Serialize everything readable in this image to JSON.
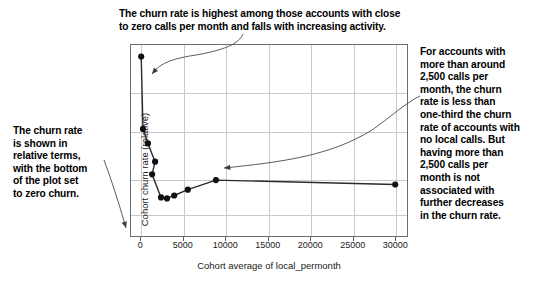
{
  "chart_data": {
    "type": "line",
    "title": "",
    "subtitle": "",
    "xlabel": "Cohort average of local_permonth",
    "ylabel": "Cohort churn rate (relative)",
    "xlim": [
      -1200,
      31500
    ],
    "ylim": [
      0,
      1.0
    ],
    "xticks": [
      0,
      5000,
      10000,
      15000,
      20000,
      25000,
      30000
    ],
    "xtick_labels": [
      "0",
      "5000",
      "10000",
      "15000",
      "20000",
      "25000",
      "30000"
    ],
    "ytick_labels": [],
    "grid": true,
    "legend": false,
    "marker": "filled-circle",
    "line_color": "#2b2b2b",
    "marker_color": "#111111",
    "grid_color": "#c9c9c9",
    "frame_color": "#6e6e6e",
    "series": [
      {
        "name": "Cohort churn rate vs local calls per month",
        "points": [
          {
            "x": 120,
            "y": 0.935
          },
          {
            "x": 330,
            "y": 0.56
          },
          {
            "x": 900,
            "y": 0.485
          },
          {
            "x": 1750,
            "y": 0.39
          },
          {
            "x": 1400,
            "y": 0.325
          },
          {
            "x": 2450,
            "y": 0.205
          },
          {
            "x": 3150,
            "y": 0.2
          },
          {
            "x": 4000,
            "y": 0.215
          },
          {
            "x": 5600,
            "y": 0.245
          },
          {
            "x": 8900,
            "y": 0.295
          },
          {
            "x": 30000,
            "y": 0.272
          }
        ]
      }
    ]
  },
  "annotations": {
    "top": {
      "id": "annotation-top",
      "text": "The churn rate is highest among those accounts with close\nto zero calls per month and falls with increasing activity.",
      "arrow": "curved-arrow-pointing-down-left-into-plot"
    },
    "left": {
      "id": "annotation-left",
      "text": "The churn rate\nis shown in\nrelative terms,\nwith the bottom\nof the plot set\nto zero churn.",
      "arrow": "curved-arrow-pointing-down-right-to-plot-origin"
    },
    "right": {
      "id": "annotation-right",
      "text": "For accounts with\nmore than around\n2,500 calls per\nmonth, the churn\nrate is less than\none-third the churn\nrate of accounts with\nno local calls. But\nhaving more than\n2,500 calls per\nmonth is not\nassociated with\nfurther decreases\nin the churn rate.",
      "arrow": "curved-arrow-pointing-down-left-into-plot"
    }
  }
}
